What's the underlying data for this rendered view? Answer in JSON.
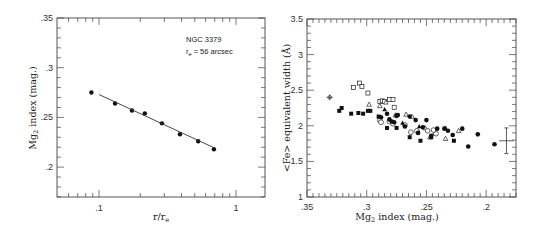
{
  "chart_data": [
    {
      "type": "scatter",
      "title": "",
      "annotation": [
        "NGC 3379",
        "r_e = 56 arcsec"
      ],
      "annotation_lines": {
        "line1": "NGC 3379",
        "line2_prefix": "r",
        "line2_sub": "e",
        "line2_rest": " = 56 arcsec"
      },
      "xlabel": "r/r_e",
      "xlabel_parts": {
        "main": "r/r",
        "sub": "e"
      },
      "ylabel": "Mg2 index (mag.)",
      "ylabel_parts": {
        "pre": "Mg",
        "sub": "2",
        "post": " index (mag.)"
      },
      "xscale": "log",
      "xlim": [
        0.05,
        1.5
      ],
      "ylim": [
        0.17,
        0.35
      ],
      "xticks": [
        {
          "v": 0.1,
          "label": ".1"
        },
        {
          "v": 1,
          "label": "1"
        }
      ],
      "yticks": [
        {
          "v": 0.2,
          "label": ".2"
        },
        {
          "v": 0.25,
          "label": ".25"
        },
        {
          "v": 0.3,
          "label": ".3"
        },
        {
          "v": 0.35,
          "label": ".35"
        }
      ],
      "grid": false,
      "series": [
        {
          "name": "NGC 3379 Mg2 gradient",
          "marker": "filled-circle",
          "points": [
            {
              "x": 0.088,
              "y": 0.275
            },
            {
              "x": 0.131,
              "y": 0.264
            },
            {
              "x": 0.174,
              "y": 0.257
            },
            {
              "x": 0.216,
              "y": 0.254
            },
            {
              "x": 0.288,
              "y": 0.244
            },
            {
              "x": 0.39,
              "y": 0.233
            },
            {
              "x": 0.53,
              "y": 0.226
            },
            {
              "x": 0.69,
              "y": 0.218
            }
          ]
        },
        {
          "name": "linear fit",
          "type": "line",
          "points": [
            {
              "x": 0.1,
              "y": 0.273
            },
            {
              "x": 0.69,
              "y": 0.2195
            }
          ]
        }
      ]
    },
    {
      "type": "scatter",
      "title": "",
      "xlabel": "Mg2 index (mag.)",
      "xlabel_parts": {
        "pre": "Mg",
        "sub": "2",
        "post": " index  (mag.)"
      },
      "ylabel": "<Fe> equivalent width (Å)",
      "xlim": [
        0.35,
        0.175
      ],
      "ylim": [
        1,
        3.5
      ],
      "xticks": [
        {
          "v": 0.35,
          "label": ".35"
        },
        {
          "v": 0.3,
          "label": ".3"
        },
        {
          "v": 0.25,
          "label": ".25"
        },
        {
          "v": 0.2,
          "label": ".2"
        }
      ],
      "yticks": [
        {
          "v": 1,
          "label": "1"
        },
        {
          "v": 1.5,
          "label": "1.5"
        },
        {
          "v": 2,
          "label": "2"
        },
        {
          "v": 2.5,
          "label": "2.5"
        },
        {
          "v": 3,
          "label": "3"
        },
        {
          "v": 3.5,
          "label": "3.5"
        }
      ],
      "grid": false,
      "series": [
        {
          "name": "open squares",
          "marker": "open-square",
          "points": [
            {
              "x": 0.311,
              "y": 2.54
            },
            {
              "x": 0.306,
              "y": 2.6
            },
            {
              "x": 0.304,
              "y": 2.55
            },
            {
              "x": 0.299,
              "y": 2.46
            },
            {
              "x": 0.289,
              "y": 2.34
            },
            {
              "x": 0.287,
              "y": 2.35
            },
            {
              "x": 0.285,
              "y": 2.34
            },
            {
              "x": 0.281,
              "y": 2.37
            },
            {
              "x": 0.278,
              "y": 2.37
            },
            {
              "x": 0.277,
              "y": 2.26
            },
            {
              "x": 0.289,
              "y": 2.08
            }
          ]
        },
        {
          "name": "open triangles",
          "marker": "open-triangle",
          "points": [
            {
              "x": 0.298,
              "y": 2.3
            },
            {
              "x": 0.289,
              "y": 2.28
            },
            {
              "x": 0.284,
              "y": 2.33
            },
            {
              "x": 0.276,
              "y": 2.15
            },
            {
              "x": 0.267,
              "y": 2.16
            },
            {
              "x": 0.262,
              "y": 2.13
            },
            {
              "x": 0.251,
              "y": 1.97
            },
            {
              "x": 0.247,
              "y": 1.84
            },
            {
              "x": 0.243,
              "y": 1.9
            },
            {
              "x": 0.234,
              "y": 1.82
            },
            {
              "x": 0.223,
              "y": 1.93
            }
          ]
        },
        {
          "name": "open circles",
          "marker": "open-circle",
          "points": [
            {
              "x": 0.288,
              "y": 2.05
            },
            {
              "x": 0.281,
              "y": 2.06
            },
            {
              "x": 0.278,
              "y": 2.03
            },
            {
              "x": 0.268,
              "y": 2.01
            },
            {
              "x": 0.263,
              "y": 1.91
            },
            {
              "x": 0.258,
              "y": 1.93
            },
            {
              "x": 0.249,
              "y": 1.93
            },
            {
              "x": 0.242,
              "y": 1.89
            },
            {
              "x": 0.244,
              "y": 1.94
            }
          ]
        },
        {
          "name": "filled squares",
          "marker": "filled-square",
          "points": [
            {
              "x": 0.323,
              "y": 2.21
            },
            {
              "x": 0.321,
              "y": 2.25
            },
            {
              "x": 0.313,
              "y": 2.17
            },
            {
              "x": 0.307,
              "y": 2.18
            },
            {
              "x": 0.303,
              "y": 2.17
            },
            {
              "x": 0.299,
              "y": 2.21
            },
            {
              "x": 0.297,
              "y": 2.21
            },
            {
              "x": 0.29,
              "y": 2.13
            },
            {
              "x": 0.283,
              "y": 1.97
            },
            {
              "x": 0.275,
              "y": 1.97
            },
            {
              "x": 0.264,
              "y": 1.84
            },
            {
              "x": 0.255,
              "y": 1.79
            },
            {
              "x": 0.246,
              "y": 1.84
            },
            {
              "x": 0.227,
              "y": 1.79
            }
          ]
        },
        {
          "name": "filled circles",
          "marker": "filled-circle",
          "points": [
            {
              "x": 0.288,
              "y": 2.12
            },
            {
              "x": 0.283,
              "y": 2.17
            },
            {
              "x": 0.281,
              "y": 2.09
            },
            {
              "x": 0.279,
              "y": 2.06
            },
            {
              "x": 0.277,
              "y": 2.05
            },
            {
              "x": 0.275,
              "y": 2.14
            },
            {
              "x": 0.274,
              "y": 2.15
            },
            {
              "x": 0.268,
              "y": 1.99
            },
            {
              "x": 0.264,
              "y": 2.13
            },
            {
              "x": 0.259,
              "y": 2.08
            },
            {
              "x": 0.257,
              "y": 1.9
            },
            {
              "x": 0.253,
              "y": 1.98
            },
            {
              "x": 0.25,
              "y": 2.08
            },
            {
              "x": 0.246,
              "y": 1.86
            },
            {
              "x": 0.241,
              "y": 1.96
            },
            {
              "x": 0.235,
              "y": 1.96
            },
            {
              "x": 0.232,
              "y": 1.93
            },
            {
              "x": 0.228,
              "y": 1.87
            },
            {
              "x": 0.22,
              "y": 1.96
            },
            {
              "x": 0.215,
              "y": 1.71
            },
            {
              "x": 0.207,
              "y": 1.88
            },
            {
              "x": 0.193,
              "y": 1.74
            }
          ]
        },
        {
          "name": "filled triangles",
          "marker": "filled-triangle",
          "points": [
            {
              "x": 0.285,
              "y": 2.23
            },
            {
              "x": 0.27,
              "y": 2.04
            },
            {
              "x": 0.256,
              "y": 1.99
            },
            {
              "x": 0.234,
              "y": 1.97
            }
          ]
        },
        {
          "name": "reference point",
          "marker": "plus-circle",
          "points": [
            {
              "x": 0.331,
              "y": 2.4
            }
          ]
        }
      ],
      "error_bar": {
        "x": 0.183,
        "y": 1.79,
        "xerr": 0.006,
        "yerr": 0.18,
        "label": "typical error"
      }
    }
  ]
}
